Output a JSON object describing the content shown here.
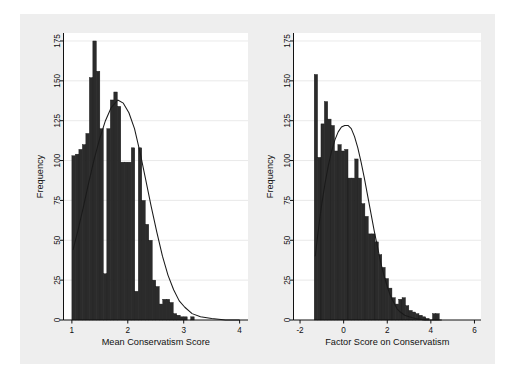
{
  "figure": {
    "background": "#ffffff",
    "panel_background": "#eeeeee",
    "plot_background": "#ffffff",
    "bar_color": "#2b2b2b",
    "density_color": "#1a1a1a",
    "grid_color": "#e3e3e3"
  },
  "chart_data": [
    {
      "type": "bar",
      "id": "left-histogram",
      "title": "",
      "xlabel": "Mean Conservatism Score",
      "ylabel": "Frequency",
      "xlim": [
        0.85,
        4.15
      ],
      "ylim": [
        0,
        180
      ],
      "xticks": [
        1,
        2,
        3,
        4
      ],
      "xticklabels": [
        "1",
        "2",
        "3",
        "4"
      ],
      "yticks": [
        0,
        25,
        50,
        75,
        100,
        125,
        150,
        175
      ],
      "yticklabels": [
        "0",
        "25",
        "50",
        "75",
        "100",
        "125",
        "150",
        "175"
      ],
      "grid": "horizontal",
      "bin_width": 0.0625,
      "bin_starts": [
        1.0,
        1.0625,
        1.125,
        1.1875,
        1.25,
        1.3125,
        1.375,
        1.4375,
        1.5,
        1.5625,
        1.625,
        1.6875,
        1.75,
        1.8125,
        1.875,
        1.9375,
        2.0,
        2.0625,
        2.125,
        2.1875,
        2.25,
        2.3125,
        2.375,
        2.4375,
        2.5,
        2.5625,
        2.625,
        2.6875,
        2.75,
        2.8125,
        2.875,
        2.9375,
        3.0,
        3.0625,
        3.125,
        3.1875,
        3.25,
        3.3125,
        3.375,
        3.4375,
        3.5,
        3.5625,
        3.625,
        3.6875,
        3.75,
        3.8125,
        3.875,
        3.9375
      ],
      "values": [
        103,
        104,
        107,
        110,
        117,
        152,
        175,
        156,
        120,
        29,
        120,
        138,
        143,
        134,
        99,
        99,
        99,
        108,
        18,
        108,
        75,
        60,
        50,
        25,
        21,
        10,
        13,
        13,
        11,
        4,
        3,
        2,
        2,
        0,
        2,
        0,
        0,
        0
      ],
      "series_note": "Overlaid normal density curve peaking near x=1.82 at frequency ~138",
      "density_curve": [
        {
          "x": 1.02,
          "y": 44
        },
        {
          "x": 1.1,
          "y": 55
        },
        {
          "x": 1.2,
          "y": 70
        },
        {
          "x": 1.3,
          "y": 86
        },
        {
          "x": 1.4,
          "y": 101
        },
        {
          "x": 1.5,
          "y": 114
        },
        {
          "x": 1.6,
          "y": 125
        },
        {
          "x": 1.7,
          "y": 133
        },
        {
          "x": 1.82,
          "y": 138
        },
        {
          "x": 1.92,
          "y": 136
        },
        {
          "x": 2.02,
          "y": 130
        },
        {
          "x": 2.12,
          "y": 120
        },
        {
          "x": 2.22,
          "y": 105
        },
        {
          "x": 2.32,
          "y": 88
        },
        {
          "x": 2.42,
          "y": 71
        },
        {
          "x": 2.52,
          "y": 55
        },
        {
          "x": 2.62,
          "y": 40
        },
        {
          "x": 2.72,
          "y": 28
        },
        {
          "x": 2.82,
          "y": 19
        },
        {
          "x": 2.92,
          "y": 12
        },
        {
          "x": 3.02,
          "y": 8
        },
        {
          "x": 3.15,
          "y": 4
        },
        {
          "x": 3.3,
          "y": 2
        },
        {
          "x": 3.5,
          "y": 1
        },
        {
          "x": 3.75,
          "y": 0
        },
        {
          "x": 4.0,
          "y": 0
        }
      ]
    },
    {
      "type": "bar",
      "id": "right-histogram",
      "title": "",
      "xlabel": "Factor Score on Conservatism",
      "ylabel": "Frequency",
      "xlim": [
        -2.3,
        6.3
      ],
      "ylim": [
        0,
        180
      ],
      "xticks": [
        -2,
        0,
        2,
        4,
        6
      ],
      "xticklabels": [
        "-2",
        "0",
        "2",
        "4",
        "6"
      ],
      "yticks": [
        0,
        25,
        50,
        75,
        100,
        125,
        150,
        175
      ],
      "yticklabels": [
        "0",
        "25",
        "50",
        "75",
        "100",
        "125",
        "150",
        "175"
      ],
      "grid": "horizontal",
      "bin_width": 0.155,
      "bin_starts": [
        -1.35,
        -1.195,
        -1.04,
        -0.885,
        -0.73,
        -0.575,
        -0.42,
        -0.265,
        -0.11,
        0.045,
        0.2,
        0.355,
        0.51,
        0.665,
        0.82,
        0.975,
        1.13,
        1.285,
        1.44,
        1.595,
        1.75,
        1.905,
        2.06,
        2.215,
        2.37,
        2.525,
        2.68,
        2.835,
        2.99,
        3.145,
        3.3,
        3.455,
        3.61,
        3.765,
        3.92,
        4.075,
        4.23,
        4.385,
        4.54
      ],
      "values": [
        154,
        102,
        123,
        137,
        126,
        122,
        106,
        110,
        106,
        107,
        89,
        89,
        101,
        89,
        73,
        65,
        54,
        54,
        49,
        41,
        33,
        26,
        20,
        14,
        10,
        13,
        14,
        9,
        6,
        5,
        4,
        3,
        2,
        1,
        0,
        4,
        4,
        0,
        0
      ],
      "series_note": "Overlaid normal density curve peaking near x=0.18 at frequency ~122",
      "density_curve": [
        {
          "x": -1.3,
          "y": 40
        },
        {
          "x": -1.2,
          "y": 52
        },
        {
          "x": -1.1,
          "y": 63
        },
        {
          "x": -1.0,
          "y": 73
        },
        {
          "x": -0.85,
          "y": 86
        },
        {
          "x": -0.7,
          "y": 97
        },
        {
          "x": -0.55,
          "y": 106
        },
        {
          "x": -0.4,
          "y": 113
        },
        {
          "x": -0.25,
          "y": 118
        },
        {
          "x": -0.1,
          "y": 121
        },
        {
          "x": 0.05,
          "y": 122
        },
        {
          "x": 0.2,
          "y": 122
        },
        {
          "x": 0.35,
          "y": 120
        },
        {
          "x": 0.5,
          "y": 115
        },
        {
          "x": 0.65,
          "y": 108
        },
        {
          "x": 0.8,
          "y": 99
        },
        {
          "x": 0.95,
          "y": 89
        },
        {
          "x": 1.1,
          "y": 78
        },
        {
          "x": 1.25,
          "y": 67
        },
        {
          "x": 1.4,
          "y": 56
        },
        {
          "x": 1.55,
          "y": 46
        },
        {
          "x": 1.7,
          "y": 36
        },
        {
          "x": 1.85,
          "y": 28
        },
        {
          "x": 2.0,
          "y": 21
        },
        {
          "x": 2.15,
          "y": 15
        },
        {
          "x": 2.3,
          "y": 11
        },
        {
          "x": 2.45,
          "y": 7
        },
        {
          "x": 2.6,
          "y": 5
        },
        {
          "x": 2.8,
          "y": 3
        },
        {
          "x": 3.0,
          "y": 2
        },
        {
          "x": 3.3,
          "y": 1
        },
        {
          "x": 3.7,
          "y": 0
        },
        {
          "x": 4.5,
          "y": 0
        }
      ]
    }
  ]
}
